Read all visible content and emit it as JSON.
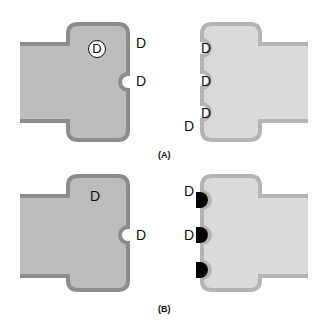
{
  "colors": {
    "left_fill": "#bcbcbc",
    "left_border": "#8c8c8c",
    "right_fill": "#dadada",
    "right_border": "#b4b4b4",
    "bump_fill": "#000000",
    "text": "#111111"
  },
  "panels": [
    {
      "caption": "(A)",
      "left_shape": {
        "labels": [
          "D",
          "D"
        ],
        "circled_label": "D"
      },
      "right_shape": {
        "labels": [
          "D",
          "D",
          "D",
          "D"
        ]
      }
    },
    {
      "caption": "(B)",
      "left_shape": {
        "labels": [
          "D",
          "D"
        ]
      },
      "right_shape": {
        "labels": [
          "D",
          "D"
        ],
        "black_bumps": 3
      }
    }
  ]
}
